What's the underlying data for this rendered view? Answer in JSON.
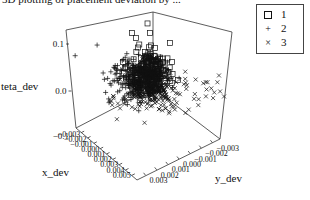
{
  "title": "3D plotting of placement deviation by ...",
  "chart_data": {
    "type": "scatter",
    "subtype": "scatter3d",
    "title": "3D plotting of placement deviation by ...",
    "xlabel": "x_dev",
    "ylabel": "y_dev",
    "zlabel": "teta_dev",
    "x_ticks": [
      "-0.003",
      "-0.002",
      "-0.001",
      "0.000",
      "0.001",
      "0.002",
      "0.003",
      "0.004",
      "0.005"
    ],
    "y_ticks": [
      "-0.003",
      "-0.002",
      "-0.001",
      "0.000",
      "0.001",
      "0.002",
      "0.003"
    ],
    "z_ticks": [
      "-0.1",
      "0.0",
      "0.1"
    ],
    "xlim": [
      -0.003,
      0.005
    ],
    "ylim": [
      -0.003,
      0.003
    ],
    "zlim": [
      -0.1,
      0.15
    ],
    "grid": false,
    "legend_position": "top-right",
    "series": [
      {
        "name": "1",
        "marker": "square",
        "description": "open squares, mostly upper part of cluster with a few high outliers (teta_dev ~0.1)",
        "approx_center": {
          "x_dev": 0.0005,
          "y_dev": 0.0,
          "teta_dev": 0.04
        }
      },
      {
        "name": "2",
        "marker": "plus",
        "description": "plus signs, dense cluster left of center",
        "approx_center": {
          "x_dev": 0.0,
          "y_dev": 0.001,
          "teta_dev": 0.0
        }
      },
      {
        "name": "3",
        "marker": "x",
        "description": "crosses, spread along lower part of cluster toward right",
        "approx_center": {
          "x_dev": 0.0005,
          "y_dev": -0.001,
          "teta_dev": -0.03
        }
      }
    ]
  },
  "legend": [
    {
      "symbol": "square",
      "glyph": "",
      "label": "1"
    },
    {
      "symbol": "plus",
      "glyph": "+",
      "label": "2"
    },
    {
      "symbol": "cross",
      "glyph": "×",
      "label": "3"
    }
  ],
  "axes": {
    "z": {
      "label": "teta_dev",
      "ticks": [
        "0.1",
        "0.0",
        "-0.1"
      ]
    },
    "x": {
      "label": "x_dev",
      "ticks": [
        "-0.003",
        "-0.002",
        "-0.001",
        "0.000",
        "0.001",
        "0.002",
        "0.003",
        "0.004",
        "0.005"
      ]
    },
    "y": {
      "label": "y_dev",
      "ticks": [
        "-0.003",
        "-0.002",
        "-0.001",
        "0.000",
        "0.001",
        "0.002",
        "0.003"
      ]
    }
  }
}
